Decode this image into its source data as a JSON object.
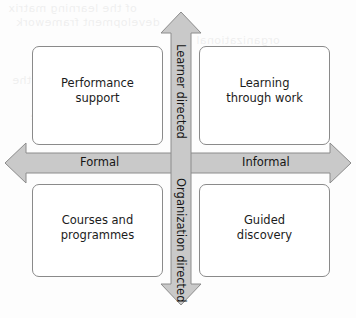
{
  "diagram": {
    "type": "2x2-quadrant-matrix",
    "colors": {
      "arrow_fill": "#c9c9c9",
      "arrow_stroke": "#8c8c8c",
      "box_border": "#8a8a8a",
      "box_fill": "#ffffff",
      "text": "#1c1c1c",
      "background": "#fdfdfd"
    },
    "axes": {
      "horizontal": {
        "left_label": "Formal",
        "right_label": "Informal",
        "double_headed": true
      },
      "vertical": {
        "top_label": "Learner directed",
        "bottom_label": "Organization directed",
        "double_headed": true
      }
    },
    "quadrants": [
      {
        "position": "top-left",
        "label": "Performance\nsupport",
        "axis_x": "Formal",
        "axis_y": "Learner directed"
      },
      {
        "position": "top-right",
        "label": "Learning\nthrough work",
        "axis_x": "Informal",
        "axis_y": "Learner directed"
      },
      {
        "position": "bottom-left",
        "label": "Courses and\nprogrammes",
        "axis_x": "Formal",
        "axis_y": "Organization directed"
      },
      {
        "position": "bottom-right",
        "label": "Guided\ndiscovery",
        "axis_x": "Informal",
        "axis_y": "Organization directed"
      }
    ],
    "background_artifacts": {
      "description": "faint mirrored bleed-through text from the reverse of the scanned page",
      "lines": [
        "of the learning matrix",
        "development framework",
        "organizational",
        "and informal",
        "support in the",
        "learning design",
        "through practice"
      ]
    }
  }
}
